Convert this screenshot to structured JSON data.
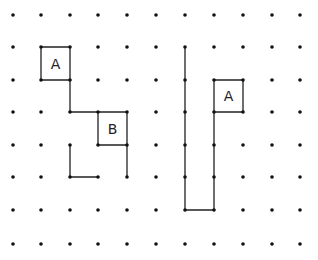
{
  "diagram": {
    "type": "dot-grid path puzzle",
    "columns_x": [
      13,
      41,
      70,
      98,
      127,
      156,
      185,
      214,
      243,
      272,
      300
    ],
    "rows_y": [
      15,
      47,
      80,
      112,
      145,
      177,
      210,
      244
    ],
    "dot_color": "#111111",
    "line_color": "#222222",
    "labels": [
      {
        "text": "A",
        "col": 1.5,
        "row": 1.5
      },
      {
        "text": "B",
        "col": 3.5,
        "row": 3.5
      },
      {
        "text": "A",
        "col": 7.5,
        "row": 2.5
      }
    ],
    "polylines": [
      [
        [
          1,
          1
        ],
        [
          2,
          1
        ],
        [
          2,
          2
        ],
        [
          1,
          2
        ],
        [
          1,
          1
        ]
      ],
      [
        [
          2,
          2
        ],
        [
          2,
          3
        ],
        [
          3,
          3
        ],
        [
          4,
          3
        ]
      ],
      [
        [
          3,
          3
        ],
        [
          3,
          4
        ],
        [
          4,
          4
        ],
        [
          4,
          3
        ]
      ],
      [
        [
          4,
          4
        ],
        [
          4,
          5
        ]
      ],
      [
        [
          2,
          4
        ],
        [
          2,
          5
        ],
        [
          3,
          5
        ]
      ],
      [
        [
          6,
          1
        ],
        [
          6,
          6
        ],
        [
          7,
          6
        ],
        [
          7,
          3
        ]
      ],
      [
        [
          7,
          2
        ],
        [
          8,
          2
        ],
        [
          8,
          3
        ],
        [
          7,
          3
        ],
        [
          7,
          2
        ]
      ]
    ]
  }
}
